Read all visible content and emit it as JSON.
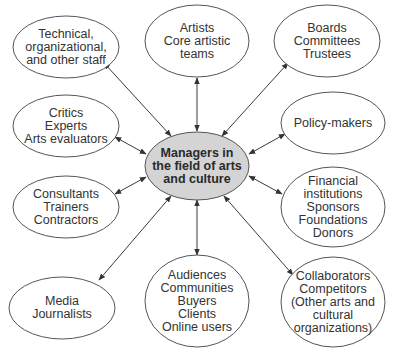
{
  "diagram": {
    "colors": {
      "stroke": "#555555",
      "center_fill": "#d4d4d4",
      "outer_fill": "#ffffff",
      "text": "#333333"
    },
    "center": {
      "id": "managers",
      "lines": [
        "Managers in",
        "the field of arts",
        "and culture"
      ],
      "cx": 197,
      "cy": 166,
      "rx": 52,
      "ry": 34
    },
    "nodes": [
      {
        "id": "staff",
        "lines": [
          "Technical,",
          "organizational,",
          "and other staff"
        ],
        "cx": 66,
        "cy": 47,
        "rx": 53,
        "ry": 31
      },
      {
        "id": "artists",
        "lines": [
          "Artists",
          "Core artistic",
          "teams"
        ],
        "cx": 197,
        "cy": 41,
        "rx": 52,
        "ry": 36
      },
      {
        "id": "boards",
        "lines": [
          "Boards",
          "Committees",
          "Trustees"
        ],
        "cx": 327,
        "cy": 41,
        "rx": 53,
        "ry": 36
      },
      {
        "id": "critics",
        "lines": [
          "Critics",
          "Experts",
          "Arts evaluators"
        ],
        "cx": 66,
        "cy": 126,
        "rx": 53,
        "ry": 31
      },
      {
        "id": "policy",
        "lines": [
          "Policy-makers"
        ],
        "cx": 333,
        "cy": 123,
        "rx": 52,
        "ry": 31
      },
      {
        "id": "consultants",
        "lines": [
          "Consultants",
          "Trainers",
          "Contractors"
        ],
        "cx": 66,
        "cy": 207,
        "rx": 53,
        "ry": 31
      },
      {
        "id": "financial",
        "lines": [
          "Financial",
          "institutions",
          "Sponsors",
          "Foundations",
          "Donors"
        ],
        "cx": 333,
        "cy": 207,
        "rx": 52,
        "ry": 40
      },
      {
        "id": "media",
        "lines": [
          "Media",
          "Journalists"
        ],
        "cx": 62,
        "cy": 308,
        "rx": 53,
        "ry": 31
      },
      {
        "id": "audiences",
        "lines": [
          "Audiences",
          "Communities",
          "Buyers",
          "Clients",
          "Online users"
        ],
        "cx": 197,
        "cy": 301,
        "rx": 52,
        "ry": 46
      },
      {
        "id": "collaborators",
        "lines": [
          "Collaborators",
          "Competitors",
          "(Other arts and",
          "cultural",
          "organizations)"
        ],
        "cx": 333,
        "cy": 302,
        "rx": 52,
        "ry": 45
      }
    ],
    "edges": [
      {
        "from": "managers",
        "to": "staff",
        "x1": 171,
        "y1": 136,
        "x2": 104,
        "y2": 63
      },
      {
        "from": "managers",
        "to": "artists",
        "x1": 197,
        "y1": 131,
        "x2": 197,
        "y2": 78
      },
      {
        "from": "managers",
        "to": "boards",
        "x1": 222,
        "y1": 136,
        "x2": 288,
        "y2": 63
      },
      {
        "from": "managers",
        "to": "critics",
        "x1": 146,
        "y1": 154,
        "x2": 115,
        "y2": 137
      },
      {
        "from": "managers",
        "to": "policy",
        "x1": 249,
        "y1": 154,
        "x2": 285,
        "y2": 134
      },
      {
        "from": "managers",
        "to": "consultants",
        "x1": 146,
        "y1": 177,
        "x2": 115,
        "y2": 194
      },
      {
        "from": "managers",
        "to": "financial",
        "x1": 249,
        "y1": 176,
        "x2": 282,
        "y2": 194
      },
      {
        "from": "managers",
        "to": "media",
        "x1": 171,
        "y1": 196,
        "x2": 99,
        "y2": 280
      },
      {
        "from": "managers",
        "to": "audiences",
        "x1": 197,
        "y1": 200,
        "x2": 197,
        "y2": 255
      },
      {
        "from": "managers",
        "to": "collaborators",
        "x1": 224,
        "y1": 196,
        "x2": 293,
        "y2": 275
      }
    ]
  }
}
